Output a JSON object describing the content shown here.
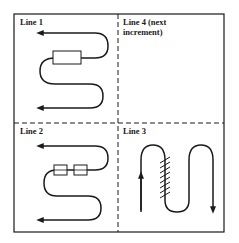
{
  "diagram": {
    "type": "routing-quadrants",
    "frame": {
      "stroke": "#1a1a1a",
      "divider_style": "dashed"
    },
    "quadrants": [
      {
        "id": "top-left",
        "label": "Line 1",
        "path": "serpentine",
        "components": 1,
        "component_style": "rectangle"
      },
      {
        "id": "top-right",
        "label": "Line 4 (next",
        "label_line2": "increment)",
        "path": "none"
      },
      {
        "id": "bottom-left",
        "label": "Line 2",
        "path": "serpentine",
        "components": 2,
        "component_style": "rectangle"
      },
      {
        "id": "bottom-right",
        "label": "Line 3",
        "path": "vertical-serpentine",
        "components": 0,
        "hatching": true
      }
    ]
  }
}
